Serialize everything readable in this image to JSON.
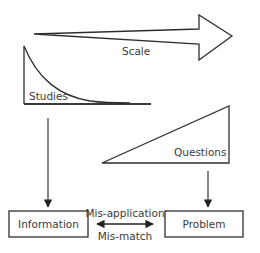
{
  "diagram": {
    "scale_arrow": {
      "label": "Scale"
    },
    "studies_curve": {
      "label": "Studies"
    },
    "questions_wedge": {
      "label": "Questions"
    },
    "information_box": {
      "label": "Information"
    },
    "problem_box": {
      "label": "Problem"
    },
    "connector": {
      "top_label": "Mis-application",
      "bottom_label": "Mis-match"
    }
  }
}
